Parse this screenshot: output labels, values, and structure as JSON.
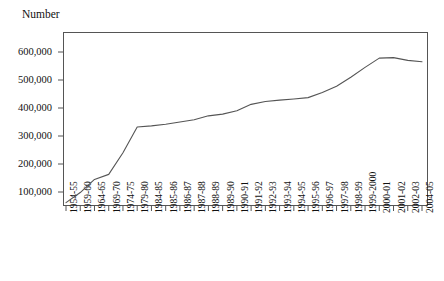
{
  "figure": {
    "clipped_caption": "",
    "axis_title": "Number"
  },
  "chart_data": {
    "type": "line",
    "title": "",
    "subtitle": "",
    "xlabel": "",
    "ylabel": "Number",
    "grid": false,
    "legend": "none",
    "ylim": [
      0,
      660000
    ],
    "ytick_labels": [
      "600,000",
      "500,000",
      "400,000",
      "300,000",
      "200,000",
      "100,000"
    ],
    "ytick_values": [
      600000,
      500000,
      400000,
      300000,
      200000,
      100000
    ],
    "categories": [
      "1954-55",
      "1959-60",
      "1964-65",
      "1969-70",
      "1974-75",
      "1979-80",
      "1984-85",
      "1985-86",
      "1986-87",
      "1987-88",
      "1988-89",
      "1989-90",
      "1990-91",
      "1991-92",
      "1992-93",
      "1993-94",
      "1994-95",
      "1995-96",
      "1996-97",
      "1997-98",
      "1998-99",
      "1999-2000",
      "2000-01",
      "2001-02",
      "2002-03",
      "2004-05"
    ],
    "series": [
      {
        "name": "Number",
        "color": "#555555",
        "values": [
          62000,
          98000,
          145000,
          163000,
          240000,
          332000,
          336000,
          342000,
          350000,
          358000,
          372000,
          378000,
          390000,
          413000,
          423000,
          428000,
          432000,
          437000,
          455000,
          478000,
          510000,
          545000,
          578000,
          580000,
          570000,
          565000
        ]
      }
    ],
    "annotations": []
  }
}
